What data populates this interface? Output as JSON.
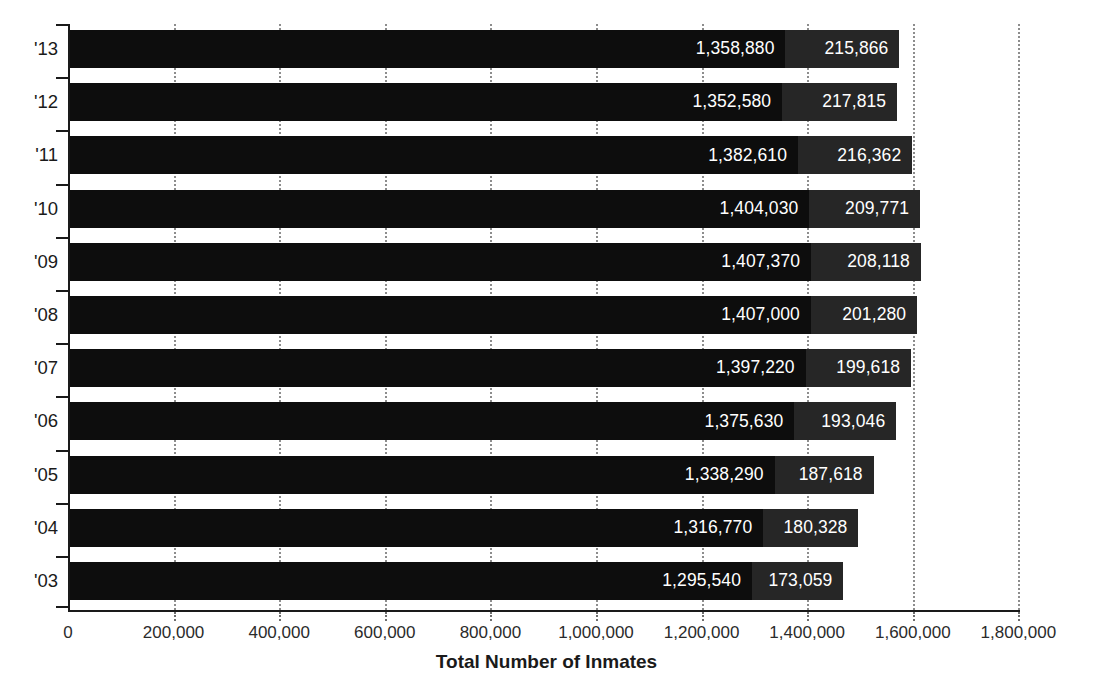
{
  "chart_data": {
    "type": "bar",
    "orientation": "horizontal",
    "stacked": true,
    "title": "",
    "xlabel": "Total Number of Inmates",
    "ylabel": "",
    "xlim": [
      0,
      1800000
    ],
    "xticks": [
      0,
      200000,
      400000,
      600000,
      800000,
      1000000,
      1200000,
      1400000,
      1600000,
      1800000
    ],
    "xtick_labels": [
      "0",
      "200,000",
      "400,000",
      "600,000",
      "800,000",
      "1,000,000",
      "1,200,000",
      "1,400,000",
      "1,600,000",
      "1,800,000"
    ],
    "grid": true,
    "grid_axis": "x",
    "grid_style": "dotted",
    "legend": null,
    "categories": [
      "'13",
      "'12",
      "'11",
      "'10",
      "'09",
      "'08",
      "'07",
      "'06",
      "'05",
      "'04",
      "'03"
    ],
    "series": [
      {
        "name": "primary",
        "color": "#0d0d0d",
        "values": [
          1358880,
          1352580,
          1382610,
          1404030,
          1407370,
          1407000,
          1397220,
          1375630,
          1338290,
          1316770,
          1295540
        ],
        "labels": [
          "1,358,880",
          "1,352,580",
          "1,382,610",
          "1,404,030",
          "1,407,370",
          "1,407,000",
          "1,397,220",
          "1,375,630",
          "1,338,290",
          "1,316,770",
          "1,295,540"
        ]
      },
      {
        "name": "secondary",
        "color": "#262626",
        "values": [
          215866,
          217815,
          216362,
          209771,
          208118,
          201280,
          199618,
          193046,
          187618,
          180328,
          173059
        ],
        "labels": [
          "215,866",
          "217,815",
          "216,362",
          "209,771",
          "208,118",
          "201,280",
          "199,618",
          "193,046",
          "187,618",
          "180,328",
          "173,059"
        ]
      }
    ],
    "totals": [
      1574746,
      1570395,
      1598972,
      1613801,
      1615488,
      1608280,
      1596838,
      1568676,
      1525908,
      1497098,
      1468599
    ]
  },
  "axis": {
    "x_title": "Total Number of Inmates"
  }
}
